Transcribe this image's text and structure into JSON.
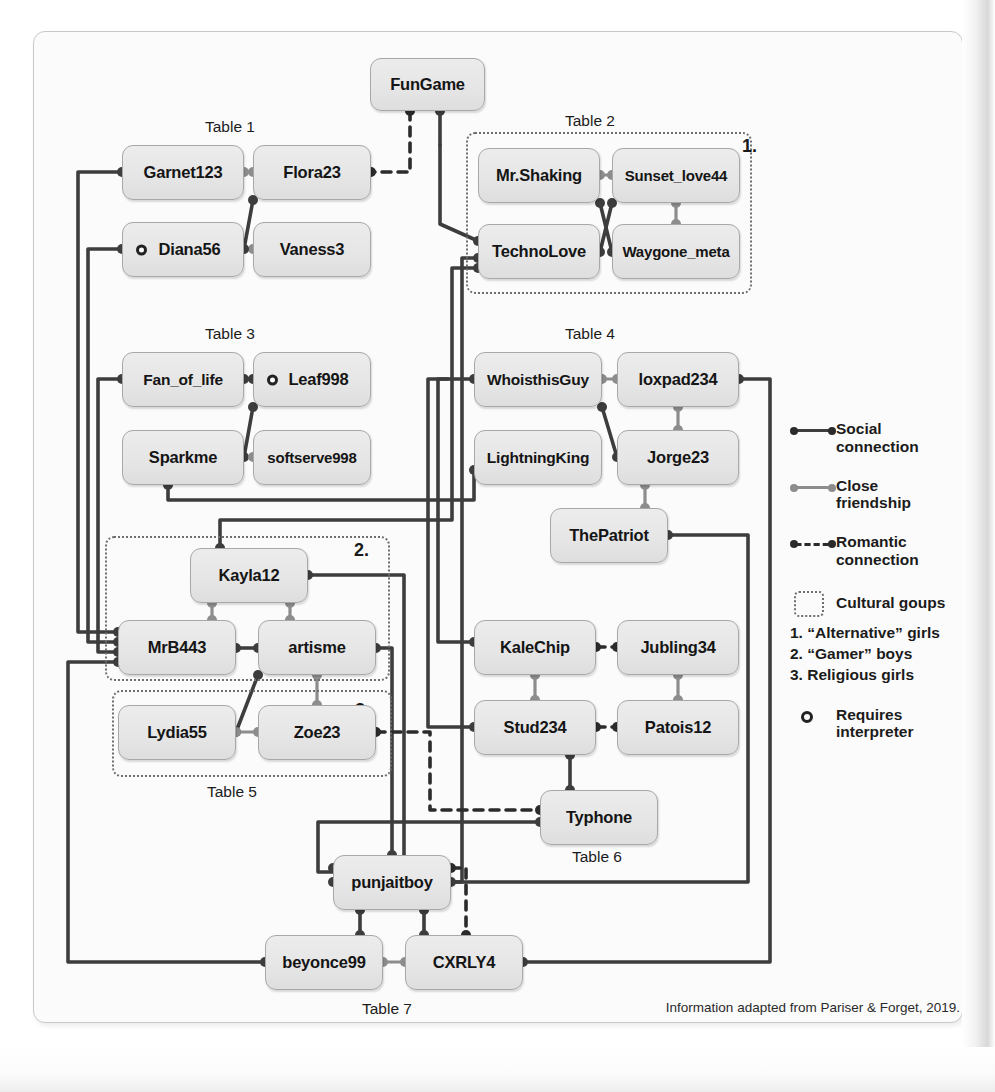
{
  "figure": {
    "source_note": "Information adapted from Pariser & Forget, 2019."
  },
  "tables": [
    {
      "id": "t1",
      "label": "Table 1",
      "x": 205,
      "y": 118
    },
    {
      "id": "t2",
      "label": "Table 2",
      "x": 565,
      "y": 112
    },
    {
      "id": "t3",
      "label": "Table 3",
      "x": 205,
      "y": 325
    },
    {
      "id": "t4",
      "label": "Table 4",
      "x": 565,
      "y": 325
    },
    {
      "id": "t5",
      "label": "Table 5",
      "x": 207,
      "y": 783
    },
    {
      "id": "t6",
      "label": "Table 6",
      "x": 572,
      "y": 848
    },
    {
      "id": "t7",
      "label": "Table 7",
      "x": 362,
      "y": 1000
    }
  ],
  "nodes": [
    {
      "id": "fungame",
      "label": "FunGame",
      "x": 370,
      "y": 58,
      "w": 115,
      "h": 53,
      "interpreter": false
    },
    {
      "id": "garnet123",
      "label": "Garnet123",
      "x": 122,
      "y": 145,
      "w": 122,
      "h": 55,
      "interpreter": false
    },
    {
      "id": "flora23",
      "label": "Flora23",
      "x": 253,
      "y": 145,
      "w": 118,
      "h": 55,
      "interpreter": false
    },
    {
      "id": "diana56",
      "label": "Diana56",
      "x": 122,
      "y": 222,
      "w": 122,
      "h": 55,
      "interpreter": true
    },
    {
      "id": "vaness3",
      "label": "Vaness3",
      "x": 253,
      "y": 222,
      "w": 118,
      "h": 55,
      "interpreter": false
    },
    {
      "id": "mrshaking",
      "label": "Mr.Shaking",
      "x": 478,
      "y": 148,
      "w": 122,
      "h": 55,
      "interpreter": false
    },
    {
      "id": "sunsetlove44",
      "label": "Sunset_love44",
      "x": 612,
      "y": 148,
      "w": 128,
      "h": 55,
      "interpreter": false
    },
    {
      "id": "technolove",
      "label": "TechnoLove",
      "x": 478,
      "y": 224,
      "w": 122,
      "h": 55,
      "interpreter": false
    },
    {
      "id": "waygone",
      "label": "Waygone_meta",
      "x": 612,
      "y": 224,
      "w": 128,
      "h": 55,
      "interpreter": false
    },
    {
      "id": "fanoflife",
      "label": "Fan_of_life",
      "x": 122,
      "y": 352,
      "w": 122,
      "h": 55,
      "interpreter": false
    },
    {
      "id": "leaf998",
      "label": "Leaf998",
      "x": 253,
      "y": 352,
      "w": 118,
      "h": 55,
      "interpreter": true
    },
    {
      "id": "sparkme",
      "label": "Sparkme",
      "x": 122,
      "y": 430,
      "w": 122,
      "h": 55,
      "interpreter": false
    },
    {
      "id": "softserve998",
      "label": "softserve998",
      "x": 253,
      "y": 430,
      "w": 118,
      "h": 55,
      "interpreter": false
    },
    {
      "id": "whoisthisguy",
      "label": "WhoisthisGuy",
      "x": 474,
      "y": 352,
      "w": 128,
      "h": 55,
      "interpreter": false
    },
    {
      "id": "loxpad234",
      "label": "loxpad234",
      "x": 617,
      "y": 352,
      "w": 122,
      "h": 55,
      "interpreter": false
    },
    {
      "id": "lightningking",
      "label": "LightningKing",
      "x": 474,
      "y": 430,
      "w": 128,
      "h": 55,
      "interpreter": false
    },
    {
      "id": "jorge23",
      "label": "Jorge23",
      "x": 617,
      "y": 430,
      "w": 122,
      "h": 55,
      "interpreter": false
    },
    {
      "id": "thepatriot",
      "label": "ThePatriot",
      "x": 550,
      "y": 508,
      "w": 118,
      "h": 55,
      "interpreter": false
    },
    {
      "id": "kayla12",
      "label": "Kayla12",
      "x": 190,
      "y": 548,
      "w": 118,
      "h": 55,
      "interpreter": false
    },
    {
      "id": "mrb443",
      "label": "MrB443",
      "x": 118,
      "y": 620,
      "w": 118,
      "h": 55,
      "interpreter": false
    },
    {
      "id": "artisme",
      "label": "artisme",
      "x": 258,
      "y": 620,
      "w": 118,
      "h": 55,
      "interpreter": false
    },
    {
      "id": "lydia55",
      "label": "Lydia55",
      "x": 118,
      "y": 705,
      "w": 118,
      "h": 55,
      "interpreter": false
    },
    {
      "id": "zoe23",
      "label": "Zoe23",
      "x": 258,
      "y": 705,
      "w": 118,
      "h": 55,
      "interpreter": false
    },
    {
      "id": "kalechip",
      "label": "KaleChip",
      "x": 474,
      "y": 620,
      "w": 122,
      "h": 55,
      "interpreter": false
    },
    {
      "id": "jubling34",
      "label": "Jubling34",
      "x": 617,
      "y": 620,
      "w": 122,
      "h": 55,
      "interpreter": false
    },
    {
      "id": "stud234",
      "label": "Stud234",
      "x": 474,
      "y": 700,
      "w": 122,
      "h": 55,
      "interpreter": false
    },
    {
      "id": "patois12",
      "label": "Patois12",
      "x": 617,
      "y": 700,
      "w": 122,
      "h": 55,
      "interpreter": false
    },
    {
      "id": "typhone",
      "label": "Typhone",
      "x": 540,
      "y": 790,
      "w": 118,
      "h": 55,
      "interpreter": false
    },
    {
      "id": "punjaitboy",
      "label": "punjaitboy",
      "x": 333,
      "y": 855,
      "w": 118,
      "h": 55,
      "interpreter": false
    },
    {
      "id": "beyonce99",
      "label": "beyonce99",
      "x": 265,
      "y": 935,
      "w": 118,
      "h": 55,
      "interpreter": false
    },
    {
      "id": "cxrly4",
      "label": "CXRLY4",
      "x": 405,
      "y": 935,
      "w": 118,
      "h": 55,
      "interpreter": false
    }
  ],
  "cultural_groups": [
    {
      "id": "g1",
      "number": "1.",
      "x": 466,
      "y": 132,
      "w": 286,
      "h": 162,
      "num_x": 742,
      "num_y": 136
    },
    {
      "id": "g2",
      "number": "2.",
      "x": 105,
      "y": 536,
      "w": 285,
      "h": 145,
      "num_x": 354,
      "num_y": 540
    },
    {
      "id": "g3",
      "number": "3.",
      "x": 112,
      "y": 690,
      "w": 280,
      "h": 87,
      "num_x": 355,
      "num_y": 700
    }
  ],
  "legend": {
    "items": [
      {
        "id": "social",
        "symbol": "social-connection-line",
        "label": "Social\nconnection"
      },
      {
        "id": "close",
        "symbol": "close-friendship-line",
        "label": "Close\nfriendship"
      },
      {
        "id": "romantic",
        "symbol": "romantic-connection-line",
        "label": "Romantic\nconnection"
      },
      {
        "id": "cultural",
        "symbol": "cultural-group-box",
        "label": "Cultural goups"
      }
    ],
    "group_notes": [
      "1. “Alternative” girls",
      "2. “Gamer” boys",
      "3. Religious girls"
    ],
    "interpreter": {
      "symbol": "requires-interpreter-marker",
      "label": "Requires\ninterpreter"
    }
  },
  "colors": {
    "social": "#3d3d3d",
    "close": "#8d8d8d",
    "romantic": "#2b2b2b",
    "group_border": "#6e6e6e",
    "node_fill": "#e6e6e6",
    "node_border": "#a8a8a8"
  },
  "edges": [
    {
      "from": "fungame",
      "to": "flora23",
      "type": "romantic"
    },
    {
      "from": "fungame",
      "to": "technolove",
      "type": "social"
    },
    {
      "from": "garnet123",
      "to": "flora23",
      "type": "close"
    },
    {
      "from": "diana56",
      "to": "flora23",
      "type": "social"
    },
    {
      "from": "diana56",
      "to": "vaness3",
      "type": "close"
    },
    {
      "from": "mrshaking",
      "to": "sunsetlove44",
      "type": "close"
    },
    {
      "from": "mrshaking",
      "to": "waygone",
      "type": "social"
    },
    {
      "from": "technolove",
      "to": "sunsetlove44",
      "type": "social"
    },
    {
      "from": "sunsetlove44",
      "to": "waygone",
      "type": "close"
    },
    {
      "from": "fanoflife",
      "to": "leaf998",
      "type": "social"
    },
    {
      "from": "leaf998",
      "to": "sparkme",
      "type": "social"
    },
    {
      "from": "sparkme",
      "to": "softserve998",
      "type": "close"
    },
    {
      "from": "whoisthisguy",
      "to": "loxpad234",
      "type": "close"
    },
    {
      "from": "whoisthisguy",
      "to": "jorge23",
      "type": "social"
    },
    {
      "from": "loxpad234",
      "to": "jorge23",
      "type": "close"
    },
    {
      "from": "jorge23",
      "to": "thepatriot",
      "type": "close"
    },
    {
      "from": "kayla12",
      "to": "mrb443",
      "type": "close"
    },
    {
      "from": "kayla12",
      "to": "artisme",
      "type": "close"
    },
    {
      "from": "mrb443",
      "to": "artisme",
      "type": "social"
    },
    {
      "from": "artisme",
      "to": "lydia55",
      "type": "social"
    },
    {
      "from": "artisme",
      "to": "zoe23",
      "type": "close"
    },
    {
      "from": "lydia55",
      "to": "zoe23",
      "type": "close"
    },
    {
      "from": "kalechip",
      "to": "jubling34",
      "type": "romantic"
    },
    {
      "from": "kalechip",
      "to": "stud234",
      "type": "close"
    },
    {
      "from": "jubling34",
      "to": "patois12",
      "type": "close"
    },
    {
      "from": "stud234",
      "to": "patois12",
      "type": "romantic"
    },
    {
      "from": "stud234",
      "to": "typhone",
      "type": "social"
    },
    {
      "from": "punjaitboy",
      "to": "beyonce99",
      "type": "social"
    },
    {
      "from": "punjaitboy",
      "to": "cxrly4",
      "type": "social"
    },
    {
      "from": "punjaitboy",
      "to": "cxrly4",
      "type": "romantic"
    },
    {
      "from": "beyonce99",
      "to": "cxrly4",
      "type": "close"
    },
    {
      "from": "zoe23",
      "to": "typhone",
      "type": "romantic"
    },
    {
      "from": "garnet123",
      "to": "mrb443",
      "type": "social"
    },
    {
      "from": "diana56",
      "to": "mrb443",
      "type": "social"
    },
    {
      "from": "fanoflife",
      "to": "mrb443",
      "type": "social"
    },
    {
      "from": "mrb443",
      "to": "beyonce99",
      "type": "social"
    },
    {
      "from": "sparkme",
      "to": "lightningking",
      "type": "social"
    },
    {
      "from": "technolove",
      "to": "punjaitboy",
      "type": "social"
    },
    {
      "from": "technolove",
      "to": "kayla12",
      "type": "social"
    },
    {
      "from": "whoisthisguy",
      "to": "kalechip",
      "type": "social"
    },
    {
      "from": "whoisthisguy",
      "to": "stud234",
      "type": "social"
    },
    {
      "from": "kayla12",
      "to": "thepatriot",
      "type": "social"
    },
    {
      "from": "artisme",
      "to": "punjaitboy",
      "type": "social"
    },
    {
      "from": "thepatriot",
      "to": "punjaitboy",
      "type": "social"
    },
    {
      "from": "loxpad234",
      "to": "cxrly4",
      "type": "social"
    },
    {
      "from": "punjaitboy",
      "to": "typhone",
      "type": "social"
    }
  ]
}
